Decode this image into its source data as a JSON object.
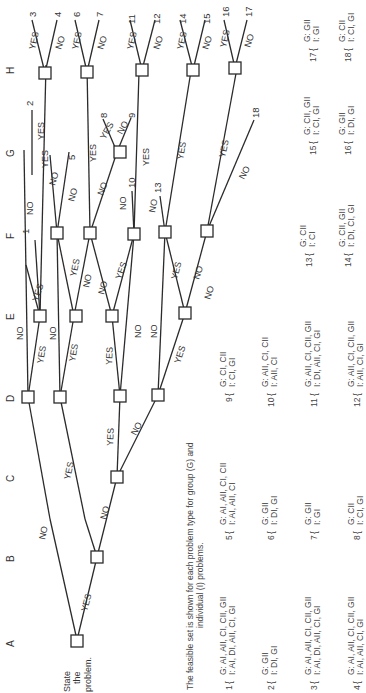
{
  "diagram": {
    "orientation": "rotated-90-ccw",
    "start_label": [
      "State",
      "the",
      "problem."
    ],
    "columns": [
      "A",
      "B",
      "C",
      "D",
      "E",
      "F",
      "G",
      "H"
    ],
    "edge_labels": {
      "yes": "YES",
      "no": "NO"
    },
    "leaves": [
      "1",
      "2",
      "3",
      "4",
      "5",
      "6",
      "7",
      "8",
      "9",
      "10",
      "11",
      "12",
      "13",
      "14",
      "15",
      "16",
      "17",
      "18"
    ],
    "caption": [
      "The feasible set is shown for each problem type for group (G) and",
      "individual (I) problems."
    ],
    "feasible_sets": [
      {
        "id": "1",
        "g": "G: AI, AII, CI, CII, GII",
        "i": "I: AI, DI, AII, CI, GI"
      },
      {
        "id": "2",
        "g": "G: GII",
        "i": "I: DI, GI"
      },
      {
        "id": "3",
        "g": "G: AI, AII, CI, CII, GII",
        "i": "I: AI, DI, AII, CI, GI"
      },
      {
        "id": "4",
        "g": "G: AI, AII, CI, CII, GII",
        "i": "I: AI, AII, CI, GI"
      },
      {
        "id": "5",
        "g": "G: AI, AII, CI, CII",
        "i": "I: AI, AII, CI"
      },
      {
        "id": "6",
        "g": "G: GII",
        "i": "I: DI, GI"
      },
      {
        "id": "7",
        "g": "G: GII",
        "i": "I: GI"
      },
      {
        "id": "8",
        "g": "G: CII",
        "i": "I: CI, GI"
      },
      {
        "id": "9",
        "g": "G: CI, CII",
        "i": "I: CI, GI"
      },
      {
        "id": "10",
        "g": "G: AII, CI, CII",
        "i": "I: AII, CI"
      },
      {
        "id": "11",
        "g": "G: AII, CI, CII, GII",
        "i": "I: DI, AII, CI, GI"
      },
      {
        "id": "12",
        "g": "G: AII, CI, CII, GII",
        "i": "I: AII, CI, GI"
      },
      {
        "id": "13",
        "g": "G: CII",
        "i": "I: CI"
      },
      {
        "id": "14",
        "g": "G: CII, GII",
        "i": "I: DI, CI, GI"
      },
      {
        "id": "15",
        "g": "G: CII, GII",
        "i": "I: CI, GI"
      },
      {
        "id": "16",
        "g": "G: GII",
        "i": "I: DI, GI"
      },
      {
        "id": "17",
        "g": "G: GII",
        "i": "I: GI"
      },
      {
        "id": "18",
        "g": "G: CII",
        "i": "I: CI, GI"
      }
    ]
  }
}
